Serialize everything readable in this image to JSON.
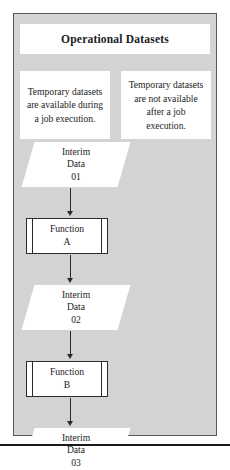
{
  "figure": {
    "title": "Operational Datasets",
    "container_fill": "#d3d3d3",
    "node_fill": "#ffffff",
    "line_color": "#2b2b2b"
  },
  "notes": [
    {
      "id": "note-left",
      "text": "Temporary datasets are available during a job execution."
    },
    {
      "id": "note-right",
      "text": "Temporary datasets are not available after a job execution."
    }
  ],
  "flow": {
    "nodes": [
      {
        "id": "interim-data-01",
        "type": "data",
        "line1": "Interim",
        "line2": "Data",
        "line3": "01"
      },
      {
        "id": "function-a",
        "type": "function",
        "line1": "Function",
        "line2": "A"
      },
      {
        "id": "interim-data-02",
        "type": "data",
        "line1": "Interim",
        "line2": "Data",
        "line3": "02"
      },
      {
        "id": "function-b",
        "type": "function",
        "line1": "Function",
        "line2": "B"
      },
      {
        "id": "interim-data-03",
        "type": "data",
        "line1": "Interim",
        "line2": "Data",
        "line3": "03"
      }
    ]
  }
}
